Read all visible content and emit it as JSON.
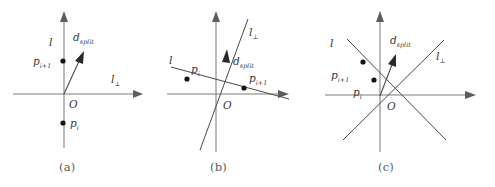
{
  "figure": {
    "background_color": "#ffffff",
    "line_color": "#4a4a4a",
    "axis_color": "#7d7d7d",
    "point_color": "#141414",
    "label_color": "#3a3a3a",
    "caption_color": "#5a5a5a"
  },
  "labels": {
    "l": "l",
    "l_perp_base": "l",
    "l_perp_sub": "⊥",
    "d_base": "d",
    "d_sub": "split",
    "p_i_base": "p",
    "p_i_sub": "i",
    "p_i1_base": "p",
    "p_i1_sub": "i+1",
    "origin": "O"
  },
  "panels": [
    {
      "id": "a",
      "caption": "(a)",
      "caption_x": 67,
      "description": "l is the vertical axis, l-perp is the horizontal axis, d_split points up-right from origin",
      "origin": {
        "x": 63,
        "y": 94
      },
      "labels": {
        "l": {
          "x": 50,
          "y": 43
        },
        "l_perp": {
          "x": 113,
          "y": 80
        },
        "d_split": {
          "x": 75,
          "y": 37
        },
        "origin": {
          "x": 70,
          "y": 107
        },
        "p_i1": {
          "x": 37,
          "y": 64
        },
        "p_i": {
          "x": 70,
          "y": 127
        }
      },
      "points": [
        {
          "name": "p_i_plus_1",
          "x": 63,
          "y": 61
        },
        {
          "name": "p_i",
          "x": 63,
          "y": 123
        }
      ],
      "vectors": [
        {
          "name": "d_split",
          "x1": 64,
          "y1": 94,
          "x2": 83,
          "y2": 53
        }
      ]
    },
    {
      "id": "b",
      "caption": "(b)",
      "caption_x": 218,
      "description": "l is a shallow line sloping down to the right, l-perp is a steep line, d_split points up along l-perp",
      "origin": {
        "x": 216,
        "y": 94
      },
      "labels": {
        "l": {
          "x": 170,
          "y": 68
        },
        "l_perp": {
          "x": 248,
          "y": 33
        },
        "d_split": {
          "x": 233,
          "y": 62
        },
        "origin": {
          "x": 223,
          "y": 108
        },
        "p_i1": {
          "x": 250,
          "y": 79
        },
        "p_i": {
          "x": 190,
          "y": 71
        }
      },
      "points": [
        {
          "name": "p_i",
          "x": 187,
          "y": 79
        },
        {
          "name": "p_i_plus_1",
          "x": 244,
          "y": 88
        }
      ],
      "vectors": [
        {
          "name": "d_split",
          "x1": 209,
          "y1": 113,
          "x2": 226,
          "y2": 55
        }
      ]
    },
    {
      "id": "c",
      "caption": "(c)",
      "caption_x": 385,
      "description": "l slopes down-right, l-perp slopes up-right, d_split points up-right steeply from origin",
      "origin": {
        "x": 380,
        "y": 95
      },
      "labels": {
        "l": {
          "x": 330,
          "y": 44
        },
        "l_perp": {
          "x": 436,
          "y": 56
        },
        "d_split": {
          "x": 392,
          "y": 40
        },
        "origin": {
          "x": 388,
          "y": 110
        },
        "p_i1": {
          "x": 331,
          "y": 76
        },
        "p_i": {
          "x": 353,
          "y": 93
        }
      },
      "points": [
        {
          "name": "p_i_plus_1",
          "x": 363,
          "y": 62
        },
        {
          "name": "p_i",
          "x": 374,
          "y": 80
        }
      ],
      "vectors": [
        {
          "name": "d_split",
          "x1": 380,
          "y1": 96,
          "x2": 395,
          "y2": 55
        }
      ]
    }
  ]
}
